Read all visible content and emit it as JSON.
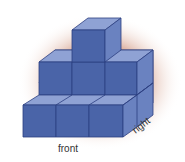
{
  "diagram": {
    "type": "isometric cube stack",
    "labels": {
      "front": "front",
      "right": "right"
    },
    "structure": {
      "bottom_row_cubes_front": 3,
      "middle_row_cubes_front": 3,
      "top_row_cubes_front": 1,
      "depth_rows": 2
    },
    "colors": {
      "front_face": "#4a64a8",
      "top_face": "#8fa2d4",
      "side_face": "#6a82c0",
      "edge": "#2c3f80",
      "shadow_glow": "#b0553a"
    }
  }
}
